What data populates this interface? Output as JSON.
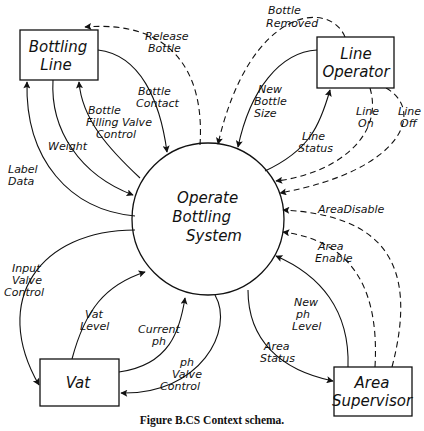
{
  "diagram": {
    "title": "Context schema",
    "caption": "Figure B.CS  Context schema.",
    "process": {
      "label_lines": [
        "Operate",
        "Bottling",
        "System"
      ]
    },
    "entities": {
      "bottling_line": {
        "label_lines": [
          "Bottling",
          "Line"
        ]
      },
      "line_operator": {
        "label_lines": [
          "Line",
          "Operator"
        ]
      },
      "vat": {
        "label_lines": [
          "Vat"
        ]
      },
      "area_supervisor": {
        "label_lines": [
          "Area",
          "Supervisor"
        ]
      }
    },
    "flows": {
      "release_bottle": {
        "lines": [
          "Release",
          "Bottle"
        ],
        "type": "dashed",
        "from": "Operate Bottling System",
        "to": "Bottling Line"
      },
      "bottle_contact": {
        "lines": [
          "Bottle",
          "Contact"
        ],
        "type": "solid",
        "from": "Bottling Line",
        "to": "Operate Bottling System"
      },
      "bottle_filling_valve_control": {
        "lines": [
          "Bottle",
          "Filling Valve",
          "Control"
        ],
        "type": "solid",
        "from": "Operate Bottling System",
        "to": "Bottling Line"
      },
      "weight": {
        "lines": [
          "Weight"
        ],
        "type": "solid",
        "from": "Bottling Line",
        "to": "Operate Bottling System"
      },
      "label_data": {
        "lines": [
          "Label",
          "Data"
        ],
        "type": "solid",
        "from": "Operate Bottling System",
        "to": "Bottling Line"
      },
      "bottle_removed": {
        "lines": [
          "Bottle",
          "Removed"
        ],
        "type": "dashed",
        "from": "Line Operator",
        "to": "Operate Bottling System"
      },
      "new_bottle_size": {
        "lines": [
          "New",
          "Bottle",
          "Size"
        ],
        "type": "solid",
        "from": "Line Operator",
        "to": "Operate Bottling System"
      },
      "line_status": {
        "lines": [
          "Line",
          "Status"
        ],
        "type": "solid",
        "from": "Operate Bottling System",
        "to": "Line Operator"
      },
      "line_on": {
        "lines": [
          "Line",
          "On"
        ],
        "type": "dashed",
        "from": "Line Operator",
        "to": "Operate Bottling System"
      },
      "line_off": {
        "lines": [
          "Line",
          "Off"
        ],
        "type": "dashed",
        "from": "Line Operator",
        "to": "Operate Bottling System"
      },
      "area_disable": {
        "lines": [
          "AreaDisable"
        ],
        "type": "dashed",
        "from": "Area Supervisor",
        "to": "Operate Bottling System"
      },
      "area_enable": {
        "lines": [
          "Area",
          "Enable"
        ],
        "type": "dashed",
        "from": "Area Supervisor",
        "to": "Operate Bottling System"
      },
      "new_ph_level": {
        "lines": [
          "New",
          "ph",
          "Level"
        ],
        "type": "solid",
        "from": "Area Supervisor",
        "to": "Operate Bottling System"
      },
      "area_status": {
        "lines": [
          "Area",
          "Status"
        ],
        "type": "solid",
        "from": "Operate Bottling System",
        "to": "Area Supervisor"
      },
      "input_valve_control": {
        "lines": [
          "Input",
          "Valve",
          "Control"
        ],
        "type": "solid",
        "from": "Operate Bottling System",
        "to": "Vat"
      },
      "vat_level": {
        "lines": [
          "Vat",
          "Level"
        ],
        "type": "solid",
        "from": "Vat",
        "to": "Operate Bottling System"
      },
      "current_ph": {
        "lines": [
          "Current",
          "ph"
        ],
        "type": "solid",
        "from": "Vat",
        "to": "Operate Bottling System"
      },
      "ph_valve_control": {
        "lines": [
          "ph",
          "Valve",
          "Control"
        ],
        "type": "solid",
        "from": "Operate Bottling System",
        "to": "Vat"
      }
    }
  }
}
